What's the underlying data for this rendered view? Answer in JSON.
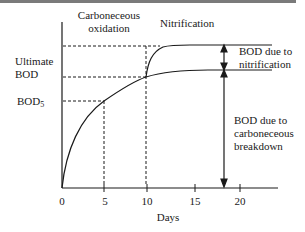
{
  "diagram": {
    "phase_labels": {
      "carbonaceous_line1": "Carboneceous",
      "carbonaceous_line2": "oxidation",
      "nitrification": "Nitrification"
    },
    "y_labels": {
      "ultimate_line1": "Ultimate",
      "ultimate_line2": "BOD",
      "bod5_main": "BOD",
      "bod5_sub": "5"
    },
    "right_labels": {
      "nitrification_line1": "BOD due to",
      "nitrification_line2": "nitrification",
      "carbonaceous_line1": "BOD due to",
      "carbonaceous_line2": "carboneceous",
      "carbonaceous_line3": "breakdown"
    },
    "x_axis": {
      "label": "Days",
      "ticks": [
        "0",
        "5",
        "10",
        "15",
        "20"
      ]
    },
    "colors": {
      "line": "#1a1a1a",
      "top_rule": "#7a7a7a"
    }
  }
}
